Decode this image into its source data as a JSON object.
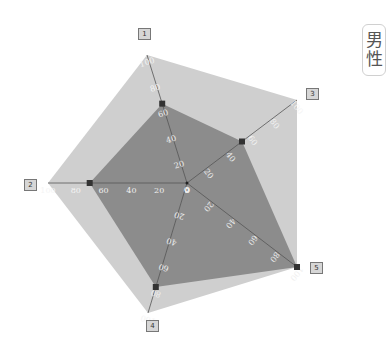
{
  "badge": {
    "char1": "男",
    "char2": "性"
  },
  "colors": {
    "outer": "#cfcfcf",
    "inner": "#8c8c8c",
    "axis": "#555555",
    "point": "#333333",
    "tick_text": "#eeeeee"
  },
  "chart_data": {
    "type": "radar",
    "title": "",
    "axes": [
      "1",
      "2",
      "3",
      "4",
      "5"
    ],
    "range": [
      0,
      100
    ],
    "ticks": [
      0,
      20,
      40,
      60,
      80,
      100
    ],
    "series": [
      {
        "name": "男性",
        "values": [
          62,
          70,
          50,
          80,
          100
        ]
      },
      {
        "name": "max",
        "values": [
          100,
          100,
          100,
          100,
          100
        ]
      }
    ],
    "grid": false,
    "legend": "none"
  }
}
